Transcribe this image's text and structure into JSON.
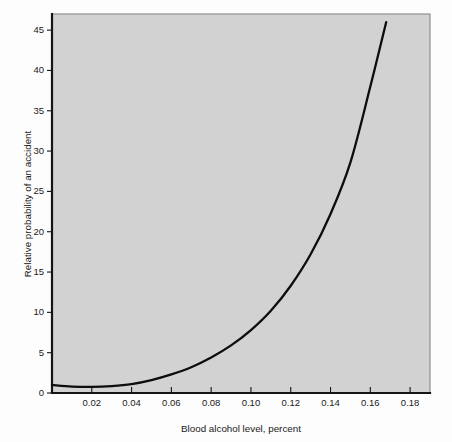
{
  "chart_data": {
    "type": "line",
    "title": "",
    "subtitle": "",
    "xlabel": "Blood alcohol level, percent",
    "ylabel": "Relative probability of an accident",
    "xlim": [
      0.0,
      0.19
    ],
    "ylim": [
      0,
      47
    ],
    "grid": false,
    "legend": null,
    "legend_position": "none",
    "xticks": [
      0.02,
      0.04,
      0.06,
      0.08,
      0.1,
      0.12,
      0.14,
      0.16,
      0.18
    ],
    "xtick_labels": [
      "0.02",
      "0.04",
      "0.06",
      "0.08",
      "0.10",
      "0.12",
      "0.14",
      "0.16",
      "0.18"
    ],
    "yticks": [
      0,
      5,
      10,
      15,
      20,
      25,
      30,
      35,
      40,
      45
    ],
    "ytick_labels": [
      "0",
      "5",
      "10",
      "15",
      "20",
      "25",
      "30",
      "35",
      "40",
      "45"
    ],
    "series": [
      {
        "name": "Relative probability of an accident",
        "color": "#0d0d0d",
        "x": [
          0.0,
          0.01,
          0.02,
          0.03,
          0.04,
          0.05,
          0.06,
          0.07,
          0.08,
          0.09,
          0.1,
          0.11,
          0.12,
          0.13,
          0.14,
          0.15,
          0.16,
          0.168
        ],
        "y": [
          1.0,
          0.8,
          0.75,
          0.85,
          1.1,
          1.6,
          2.3,
          3.2,
          4.4,
          5.9,
          7.8,
          10.2,
          13.3,
          17.2,
          22.2,
          28.6,
          38.0,
          46.0
        ]
      }
    ],
    "annotations": []
  },
  "axis_labels": {
    "x_title": "Blood alcohol level, percent",
    "y_title": "Relative probability of an accident"
  },
  "colors": {
    "page_background": "#fdfdfd",
    "plot_background": "#d2d2d2",
    "curve": "#0d0d0d",
    "axis": "#151515",
    "frame": "#8f8f8f"
  }
}
